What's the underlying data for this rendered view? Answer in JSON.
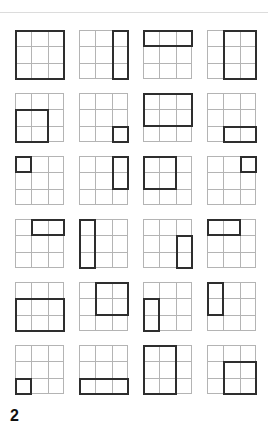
{
  "figure": {
    "grid_size": 3,
    "columns": 4,
    "rows": 6,
    "colors": {
      "cell_line": "#b4b4b4",
      "highlight": "#2e2e2e",
      "rule": "#dcdcdc"
    },
    "grids": [
      {
        "r": 0,
        "c": 0,
        "rows": 3,
        "cols": 3
      },
      {
        "r": 0,
        "c": 2,
        "rows": 3,
        "cols": 1
      },
      {
        "r": 0,
        "c": 0,
        "rows": 1,
        "cols": 3
      },
      {
        "r": 0,
        "c": 1,
        "rows": 3,
        "cols": 2
      },
      {
        "r": 1,
        "c": 0,
        "rows": 2,
        "cols": 2
      },
      {
        "r": 2,
        "c": 2,
        "rows": 1,
        "cols": 1
      },
      {
        "r": 0,
        "c": 0,
        "rows": 2,
        "cols": 3
      },
      {
        "r": 2,
        "c": 1,
        "rows": 1,
        "cols": 2
      },
      {
        "r": 0,
        "c": 0,
        "rows": 1,
        "cols": 1
      },
      {
        "r": 0,
        "c": 2,
        "rows": 2,
        "cols": 1
      },
      {
        "r": 0,
        "c": 0,
        "rows": 2,
        "cols": 2
      },
      {
        "r": 0,
        "c": 2,
        "rows": 1,
        "cols": 1
      },
      {
        "r": 0,
        "c": 1,
        "rows": 1,
        "cols": 2
      },
      {
        "r": 0,
        "c": 0,
        "rows": 3,
        "cols": 1
      },
      {
        "r": 1,
        "c": 2,
        "rows": 2,
        "cols": 1
      },
      {
        "r": 0,
        "c": 0,
        "rows": 1,
        "cols": 2
      },
      {
        "r": 1,
        "c": 0,
        "rows": 2,
        "cols": 3
      },
      {
        "r": 0,
        "c": 1,
        "rows": 2,
        "cols": 2
      },
      {
        "r": 1,
        "c": 0,
        "rows": 2,
        "cols": 1
      },
      {
        "r": 0,
        "c": 0,
        "rows": 2,
        "cols": 1
      },
      {
        "r": 2,
        "c": 0,
        "rows": 1,
        "cols": 1
      },
      {
        "r": 2,
        "c": 0,
        "rows": 1,
        "cols": 3
      },
      {
        "r": 0,
        "c": 0,
        "rows": 3,
        "cols": 2
      },
      {
        "r": 1,
        "c": 1,
        "rows": 2,
        "cols": 2
      }
    ]
  },
  "footer": {
    "page_number": "2"
  }
}
